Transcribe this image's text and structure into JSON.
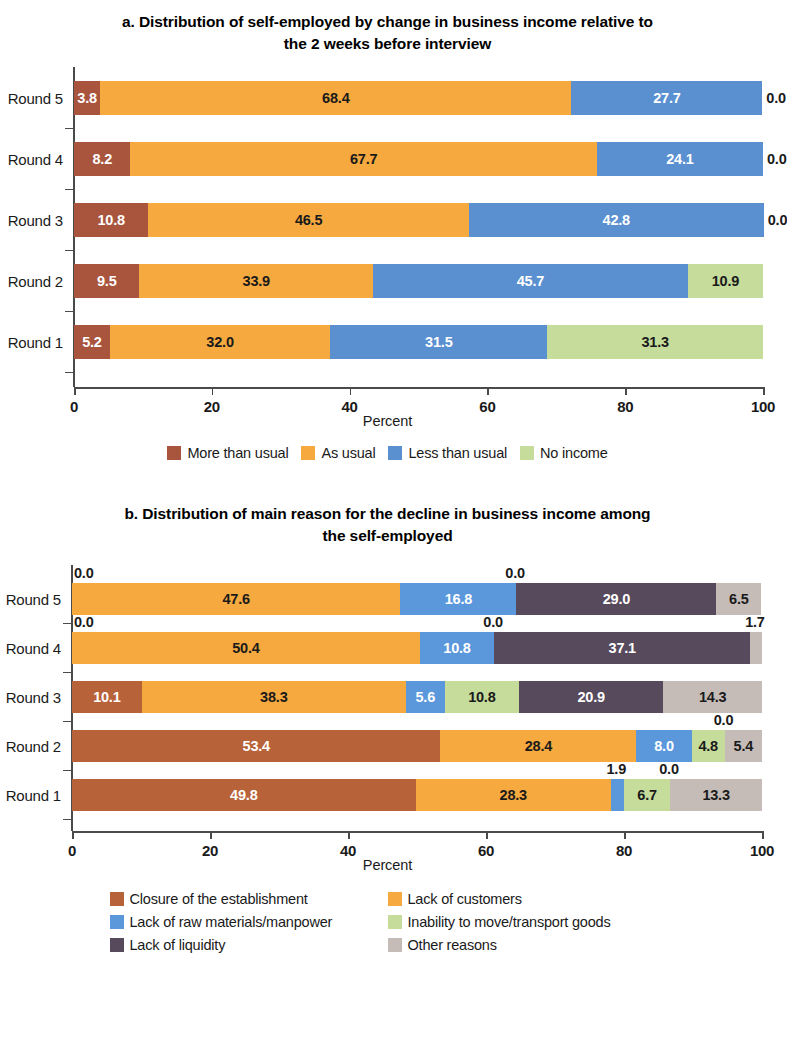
{
  "chart_data": [
    {
      "type": "bar",
      "id": "panel-a",
      "orientation": "horizontal",
      "stacked": true,
      "title": "a. Distribution of self-employed by change in business income relative to the 2 weeks before interview",
      "xlabel": "Percent",
      "ylabel": "",
      "xlim": [
        0,
        100
      ],
      "xticks": [
        "0",
        "20",
        "40",
        "60",
        "80",
        "100"
      ],
      "grid": false,
      "legend_position": "bottom",
      "categories": [
        "Round 5",
        "Round 4",
        "Round 3",
        "Round 2",
        "Round 1"
      ],
      "series": [
        {
          "name": "More than usual",
          "color": "#a9543d",
          "values": [
            3.8,
            8.2,
            10.8,
            9.5,
            5.2
          ]
        },
        {
          "name": "As usual",
          "color": "#f5a93f",
          "values": [
            68.4,
            67.7,
            46.5,
            33.9,
            32.0
          ]
        },
        {
          "name": "Less than usual",
          "color": "#5a8fd0",
          "values": [
            27.7,
            24.1,
            42.8,
            45.7,
            31.5
          ]
        },
        {
          "name": "No income",
          "color": "#c5dc9b",
          "values": [
            0.0,
            0.0,
            0.0,
            10.9,
            31.3
          ]
        }
      ],
      "labels": [
        [
          "3.8",
          "68.4",
          "27.7",
          "0.0"
        ],
        [
          "8.2",
          "67.7",
          "24.1",
          "0.0"
        ],
        [
          "10.8",
          "46.5",
          "42.8",
          "0.0"
        ],
        [
          "9.5",
          "33.9",
          "45.7",
          "10.9"
        ],
        [
          "5.2",
          "32.0",
          "31.5",
          "31.3"
        ]
      ]
    },
    {
      "type": "bar",
      "id": "panel-b",
      "orientation": "horizontal",
      "stacked": true,
      "title": "b. Distribution of main reason for the decline in business income among the self-employed",
      "xlabel": "Percent",
      "ylabel": "",
      "xlim": [
        0,
        100
      ],
      "xticks": [
        "0",
        "20",
        "40",
        "60",
        "80",
        "100"
      ],
      "grid": false,
      "legend_position": "bottom",
      "categories": [
        "Round 5",
        "Round 4",
        "Round 3",
        "Round 2",
        "Round 1"
      ],
      "series": [
        {
          "name": "Closure of the establishment",
          "color": "#b8623a",
          "values": [
            0.0,
            0.0,
            10.1,
            53.4,
            49.8
          ]
        },
        {
          "name": "Lack of customers",
          "color": "#f5a93f",
          "values": [
            47.6,
            50.4,
            38.3,
            28.4,
            28.3
          ]
        },
        {
          "name": "Lack of raw materials/manpower",
          "color": "#5a97db",
          "values": [
            16.8,
            10.8,
            5.6,
            8.0,
            1.9
          ]
        },
        {
          "name": "Inability to move/transport goods",
          "color": "#c5dc9b",
          "values": [
            0.0,
            0.0,
            10.8,
            4.8,
            6.7
          ]
        },
        {
          "name": "Lack of liquidity",
          "color": "#574a5c",
          "values": [
            29.0,
            37.1,
            20.9,
            0.0,
            0.0
          ]
        },
        {
          "name": "Other reasons",
          "color": "#c5bcb8",
          "values": [
            6.5,
            1.7,
            14.3,
            5.4,
            13.3
          ]
        }
      ],
      "labels": [
        [
          "0.0",
          "47.6",
          "16.8",
          "0.0",
          "29.0",
          "6.5"
        ],
        [
          "0.0",
          "50.4",
          "10.8",
          "0.0",
          "37.1",
          "1.7"
        ],
        [
          "10.1",
          "38.3",
          "5.6",
          "10.8",
          "20.9",
          "14.3"
        ],
        [
          "53.4",
          "28.4",
          "8.0",
          "4.8",
          "0.0",
          "5.4"
        ],
        [
          "49.8",
          "28.3",
          "1.9",
          "6.7",
          "0.0",
          "13.3"
        ]
      ]
    }
  ],
  "panel_a": {
    "title": "a. Distribution of self-employed by change in business income relative to the 2 weeks before interview",
    "title_line1": "a. Distribution of self-employed by change in business income relative to",
    "title_line2": "the 2 weeks before interview",
    "axis_title": "Percent",
    "xticks": [
      "0",
      "20",
      "40",
      "60",
      "80",
      "100"
    ],
    "rows": [
      {
        "label": "Round 5",
        "values": [
          3.8,
          68.4,
          27.7,
          0.0
        ],
        "labels": [
          "3.8",
          "68.4",
          "27.7",
          "0.0"
        ]
      },
      {
        "label": "Round 4",
        "values": [
          8.2,
          67.7,
          24.1,
          0.0
        ],
        "labels": [
          "8.2",
          "67.7",
          "24.1",
          "0.0"
        ]
      },
      {
        "label": "Round 3",
        "values": [
          10.8,
          46.5,
          42.8,
          0.0
        ],
        "labels": [
          "10.8",
          "46.5",
          "42.8",
          "0.0"
        ]
      },
      {
        "label": "Round 2",
        "values": [
          9.5,
          33.9,
          45.7,
          10.9
        ],
        "labels": [
          "9.5",
          "33.9",
          "45.7",
          "10.9"
        ]
      },
      {
        "label": "Round 1",
        "values": [
          5.2,
          32.0,
          31.5,
          31.3
        ],
        "labels": [
          "5.2",
          "32.0",
          "31.5",
          "31.3"
        ]
      }
    ],
    "legend": [
      {
        "label": "More than usual",
        "color": "#a9543d"
      },
      {
        "label": "As usual",
        "color": "#f5a93f"
      },
      {
        "label": "Less than usual",
        "color": "#5a8fd0"
      },
      {
        "label": "No income",
        "color": "#c5dc9b"
      }
    ]
  },
  "panel_b": {
    "title": "b. Distribution of main reason for the decline in business income among the self-employed",
    "title_line1": "b. Distribution of main reason for the decline in business income among",
    "title_line2": "the self-employed",
    "axis_title": "Percent",
    "xticks": [
      "0",
      "20",
      "40",
      "60",
      "80",
      "100"
    ],
    "rows": [
      {
        "label": "Round 5",
        "values": [
          0.0,
          47.6,
          16.8,
          0.0,
          29.0,
          6.5
        ],
        "labels": [
          "0.0",
          "47.6",
          "16.8",
          "0.0",
          "29.0",
          "6.5"
        ]
      },
      {
        "label": "Round 4",
        "values": [
          0.0,
          50.4,
          10.8,
          0.0,
          37.1,
          1.7
        ],
        "labels": [
          "0.0",
          "50.4",
          "10.8",
          "0.0",
          "37.1",
          "1.7"
        ]
      },
      {
        "label": "Round 3",
        "values": [
          10.1,
          38.3,
          5.6,
          10.8,
          20.9,
          14.3
        ],
        "labels": [
          "10.1",
          "38.3",
          "5.6",
          "10.8",
          "20.9",
          "14.3"
        ]
      },
      {
        "label": "Round 2",
        "values": [
          53.4,
          28.4,
          8.0,
          4.8,
          0.0,
          5.4
        ],
        "labels": [
          "53.4",
          "28.4",
          "8.0",
          "4.8",
          "0.0",
          "5.4"
        ]
      },
      {
        "label": "Round 1",
        "values": [
          49.8,
          28.3,
          1.9,
          6.7,
          0.0,
          13.3
        ],
        "labels": [
          "49.8",
          "28.3",
          "1.9",
          "6.7",
          "0.0",
          "13.3"
        ]
      }
    ],
    "legend": [
      {
        "label": "Closure of the establishment",
        "color": "#b8623a"
      },
      {
        "label": "Lack of customers",
        "color": "#f5a93f"
      },
      {
        "label": "Lack of raw materials/manpower",
        "color": "#5a97db"
      },
      {
        "label": "Inability to move/transport goods",
        "color": "#c5dc9b"
      },
      {
        "label": "Lack of liquidity",
        "color": "#574a5c"
      },
      {
        "label": "Other reasons",
        "color": "#c5bcb8"
      }
    ]
  }
}
